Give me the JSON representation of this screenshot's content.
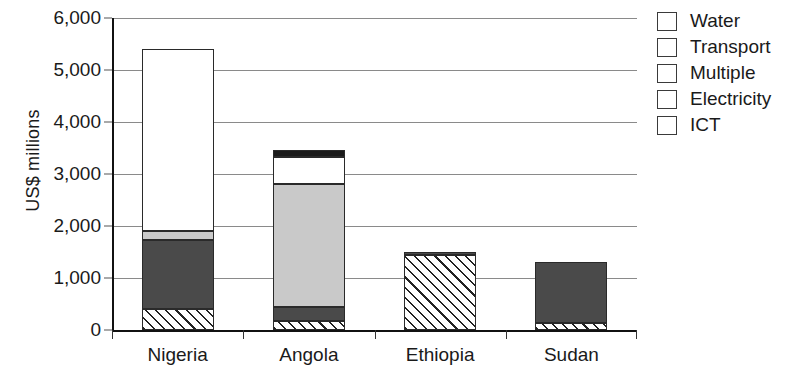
{
  "chart_data": {
    "type": "bar",
    "subtype": "stacked-bar",
    "title": "",
    "xlabel": "",
    "ylabel": "US$ millions",
    "ylim": [
      0,
      6000
    ],
    "ytick_values": [
      0,
      1000,
      2000,
      3000,
      4000,
      5000,
      6000
    ],
    "ytick_labels": [
      "0",
      "1,000",
      "2,000",
      "3,000",
      "4,000",
      "5,000",
      "6,000"
    ],
    "grid": "horizontal",
    "legend_position": "right",
    "categories": [
      "Nigeria",
      "Angola",
      "Ethiopia",
      "Sudan"
    ],
    "stack_order_bottom_to_top": [
      "ICT",
      "Electricity",
      "Multiple",
      "Transport",
      "Water"
    ],
    "series": [
      {
        "name": "ICT",
        "values": [
          400,
          170,
          1450,
          130
        ]
      },
      {
        "name": "Electricity",
        "values": [
          1330,
          280,
          50,
          1170
        ]
      },
      {
        "name": "Multiple",
        "values": [
          170,
          2350,
          0,
          0
        ]
      },
      {
        "name": "Transport",
        "values": [
          3500,
          530,
          0,
          0
        ]
      },
      {
        "name": "Water",
        "values": [
          0,
          140,
          0,
          0
        ]
      }
    ],
    "totals": [
      5400,
      3470,
      1500,
      1300
    ],
    "colors": {
      "Water": "#1b1b1b",
      "Transport": "#ffffff",
      "Multiple": "#c9c9c9",
      "Electricity": "#4a4a4a",
      "ICT": "#ffffff",
      "ICT_pattern": "diagonal-hatch",
      "gridline": "#8a8a8a",
      "axis": "#111111",
      "text": "#1a1a1a"
    }
  },
  "legend": {
    "items": [
      {
        "label": "Water",
        "fill": "fill-water"
      },
      {
        "label": "Transport",
        "fill": "fill-transport"
      },
      {
        "label": "Multiple",
        "fill": "fill-multiple"
      },
      {
        "label": "Electricity",
        "fill": "fill-electricity"
      },
      {
        "label": "ICT",
        "fill": "fill-ict"
      }
    ]
  }
}
